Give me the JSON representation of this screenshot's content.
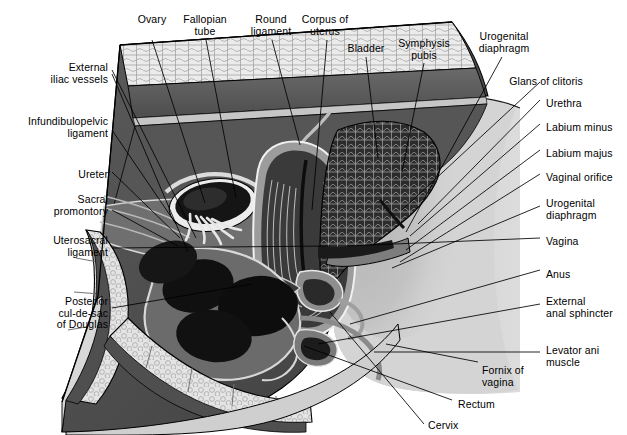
{
  "figure": {
    "type": "anatomical-illustration",
    "width": 627,
    "height": 435,
    "background_color": "#ffffff",
    "text_color": "#000000",
    "leader_line_color": "#000000"
  },
  "palette": {
    "skin_silhouette": "#d2d2d2",
    "skin_shadow": "#b9b9b9",
    "fat_layer": "#e8e8e8",
    "muscle_mid": "#6e6e6e",
    "muscle_dark": "#4a4a4a",
    "peritoneum_light": "#c9c9c9",
    "cavity_black": "#121212",
    "bone_light": "#e2e2e2",
    "organ_gray": "#7d7d7d",
    "outline": "#000000"
  },
  "labels": {
    "top": [
      {
        "text": "Ovary",
        "name": "label-ovary",
        "lines": [
          "Ovary"
        ],
        "x": 152,
        "y": 14
      },
      {
        "text": "Fallopian tube",
        "name": "label-fallopian-tube",
        "lines": [
          "Fallopian",
          "tube"
        ],
        "x": 205,
        "y": 14
      },
      {
        "text": "Round ligament",
        "name": "label-round-ligament",
        "lines": [
          "Round",
          "ligament"
        ],
        "x": 271,
        "y": 14
      },
      {
        "text": "Corpus of uterus",
        "name": "label-corpus-uteri",
        "lines": [
          "Corpus of",
          "uterus"
        ],
        "x": 325,
        "y": 14
      },
      {
        "text": "Bladder",
        "name": "label-bladder",
        "lines": [
          "Bladder"
        ],
        "x": 366,
        "y": 43
      },
      {
        "text": "Symphysis pubis",
        "name": "label-symphysis-pubis",
        "lines": [
          "Symphysis",
          "pubis"
        ],
        "x": 424,
        "y": 38
      },
      {
        "text": "Urogenital diaphragm",
        "name": "label-urogenital-diaphragm-top",
        "lines": [
          "Urogenital",
          "diaphragm"
        ],
        "x": 504,
        "y": 31
      },
      {
        "text": "Glans of clitoris",
        "name": "label-glans-of-clitoris",
        "lines": [
          "Glans of clitoris"
        ],
        "x": 546,
        "y": 76
      }
    ],
    "left": [
      {
        "text": "External iliac vessels",
        "name": "label-external-iliac-vessels",
        "lines": [
          "External",
          "iliac vessels"
        ],
        "x": 108,
        "y": 62
      },
      {
        "text": "Infundibulopelvic ligament",
        "name": "label-infundibulopelvic-ligament",
        "lines": [
          "Infundibulopelvic",
          "ligament"
        ],
        "x": 108,
        "y": 116
      },
      {
        "text": "Ureter",
        "name": "label-ureter",
        "lines": [
          "Ureter"
        ],
        "x": 108,
        "y": 169
      },
      {
        "text": "Sacral promontory",
        "name": "label-sacral-promontory",
        "lines": [
          "Sacral",
          "promontory"
        ],
        "x": 108,
        "y": 194
      },
      {
        "text": "Uterosacral ligament",
        "name": "label-uterosacral-ligament",
        "lines": [
          "Uterosacral",
          "ligament"
        ],
        "x": 108,
        "y": 235
      },
      {
        "text": "Posterior cul-de-sac of Douglas",
        "name": "label-posterior-cul-de-sac",
        "lines": [
          "Posterior",
          "cul-de-sac",
          "of Douglas"
        ],
        "x": 108,
        "y": 296
      }
    ],
    "right": [
      {
        "text": "Urethra",
        "name": "label-urethra",
        "lines": [
          "Urethra"
        ],
        "x": 546,
        "y": 98
      },
      {
        "text": "Labium minus",
        "name": "label-labium-minus",
        "lines": [
          "Labium minus"
        ],
        "x": 546,
        "y": 122
      },
      {
        "text": "Labium majus",
        "name": "label-labium-majus",
        "lines": [
          "Labium majus"
        ],
        "x": 546,
        "y": 148
      },
      {
        "text": "Vaginal orifice",
        "name": "label-vaginal-orifice",
        "lines": [
          "Vaginal orifice"
        ],
        "x": 546,
        "y": 172
      },
      {
        "text": "Urogenital diaphragm",
        "name": "label-urogenital-diaphragm-right",
        "lines": [
          "Urogenital",
          "diaphragm"
        ],
        "x": 546,
        "y": 198
      },
      {
        "text": "Vagina",
        "name": "label-vagina",
        "lines": [
          "Vagina"
        ],
        "x": 546,
        "y": 236
      },
      {
        "text": "Anus",
        "name": "label-anus",
        "lines": [
          "Anus"
        ],
        "x": 546,
        "y": 269
      },
      {
        "text": "External anal sphincter",
        "name": "label-external-anal-sphincter",
        "lines": [
          "External",
          "anal sphincter"
        ],
        "x": 546,
        "y": 296
      },
      {
        "text": "Levator ani muscle",
        "name": "label-levator-ani-muscle",
        "lines": [
          "Levator ani",
          "muscle"
        ],
        "x": 546,
        "y": 345
      }
    ],
    "bottom": [
      {
        "text": "Fornix of vagina",
        "name": "label-fornix-of-vagina",
        "lines": [
          "Fornix of",
          "vagina"
        ],
        "x": 482,
        "y": 365
      },
      {
        "text": "Rectum",
        "name": "label-rectum",
        "lines": [
          "Rectum"
        ],
        "x": 458,
        "y": 399
      },
      {
        "text": "Cervix",
        "name": "label-cervix",
        "lines": [
          "Cervix"
        ],
        "x": 428,
        "y": 420
      }
    ]
  }
}
